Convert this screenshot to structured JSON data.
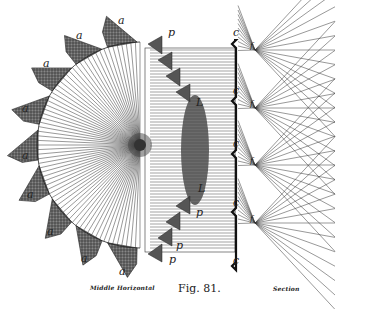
{
  "figure": {
    "number_label": "Fig. 81.",
    "left_caption": "Middle Horizontal",
    "right_caption": "Section"
  },
  "labels": {
    "a": "a",
    "p": "p",
    "c": "c",
    "f": "f",
    "L": "L"
  },
  "colors": {
    "ink": "#222222",
    "shade": "#555555",
    "background": "#ffffff"
  }
}
